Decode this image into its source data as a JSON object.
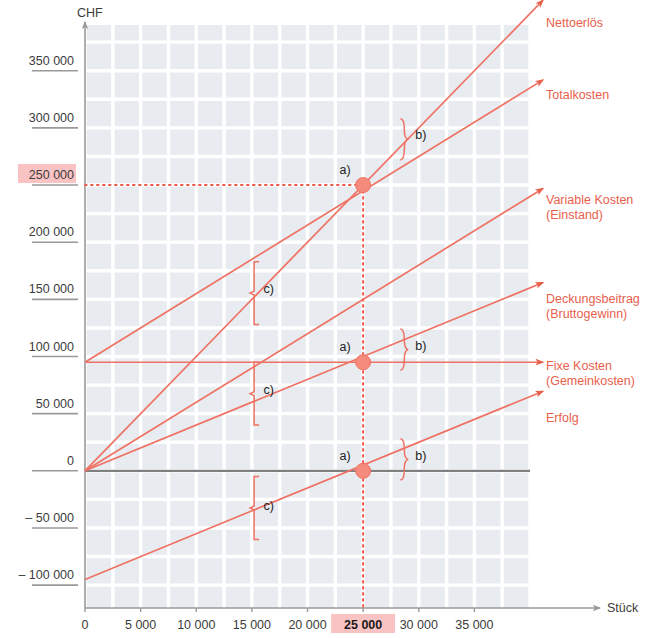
{
  "chart_data": {
    "type": "line",
    "title": "",
    "xlabel": "Stück",
    "ylabel": "CHF",
    "xlim": [
      0,
      40000
    ],
    "ylim": [
      -120000,
      390000
    ],
    "grid": true,
    "legend_position": "right-inline",
    "x_ticks": [
      "0",
      "5 000",
      "10 000",
      "15 000",
      "20 000",
      "25 000",
      "30 000",
      "35 000"
    ],
    "x_tick_values": [
      0,
      5000,
      10000,
      15000,
      20000,
      25000,
      30000,
      35000
    ],
    "y_ticks": [
      "350 000",
      "300 000",
      "250 000",
      "200 000",
      "150 000",
      "100 000",
      "50 000",
      "0",
      "–  50 000",
      "– 100 000"
    ],
    "y_tick_values": [
      350000,
      300000,
      250000,
      200000,
      150000,
      100000,
      50000,
      0,
      -50000,
      -100000
    ],
    "highlighted_x_tick": "25 000",
    "highlighted_y_tick": "250 000",
    "highlight_color": "#f9c3c3",
    "accent_color": "#e8604c",
    "line_color": "#ef7163",
    "plot_bg_color": "#e8ecf0",
    "grid_color": "#ffffff",
    "breakeven": {
      "x": 25000,
      "y": 250000
    },
    "series": [
      {
        "name": "Nettoerlös",
        "label": "Nettoerlös",
        "points": [
          [
            0,
            0
          ],
          [
            38000,
            380000
          ]
        ],
        "slope_per_unit": 10
      },
      {
        "name": "Totalkosten",
        "label": "Totalkosten",
        "points": [
          [
            0,
            95000
          ],
          [
            38000,
            323000
          ]
        ],
        "slope_per_unit": 6
      },
      {
        "name": "Variable Kosten (Einstand)",
        "label": "Variable Kosten",
        "label2": "(Einstand)",
        "points": [
          [
            0,
            0
          ],
          [
            38000,
            228000
          ]
        ],
        "slope_per_unit": 6
      },
      {
        "name": "Deckungsbeitrag (Bruttogewinn)",
        "label": "Deckungsbeitrag",
        "label2": "(Bruttogewinn)",
        "points": [
          [
            0,
            0
          ],
          [
            38000,
            152000
          ]
        ],
        "slope_per_unit": 4
      },
      {
        "name": "Fixe Kosten (Gemeinkosten)",
        "label": "Fixe Kosten",
        "label2": "(Gemeinkosten)",
        "points": [
          [
            0,
            95000
          ],
          [
            38000,
            95000
          ]
        ],
        "slope_per_unit": 0
      },
      {
        "name": "Erfolg",
        "label": "Erfolg",
        "points": [
          [
            0,
            -95000
          ],
          [
            38000,
            57000
          ]
        ],
        "slope_per_unit": 4
      }
    ],
    "annotations": [
      {
        "id": "a-top",
        "text": "a)",
        "x": 25000,
        "y": 250000
      },
      {
        "id": "a-middle",
        "text": "a)",
        "x": 25000,
        "y": 95000
      },
      {
        "id": "a-bottom",
        "text": "a)",
        "x": 25000,
        "y": 0
      },
      {
        "id": "b-top",
        "text": "b)",
        "x": 29500,
        "y": 295000
      },
      {
        "id": "b-middle",
        "text": "b)",
        "x": 29500,
        "y": 110000
      },
      {
        "id": "b-bottom",
        "text": "b)",
        "x": 29500,
        "y": 14000
      },
      {
        "id": "c-top",
        "text": "c)",
        "x": 15500,
        "y": 160000
      },
      {
        "id": "c-middle",
        "text": "c)",
        "x": 15500,
        "y": 72000
      },
      {
        "id": "c-bottom",
        "text": "c)",
        "x": 15500,
        "y": -30000
      }
    ],
    "markers": [
      {
        "x": 25000,
        "y": 250000
      },
      {
        "x": 25000,
        "y": 95000
      },
      {
        "x": 25000,
        "y": 0
      }
    ],
    "guide_lines": {
      "vertical_at_x": 25000,
      "horizontal_at_y": 250000,
      "style": "dotted",
      "color": "#ef5b4c"
    },
    "zero_axis": {
      "y": 0,
      "color": "#808080"
    }
  },
  "axis": {
    "y_title": "CHF",
    "x_title": "Stück"
  }
}
